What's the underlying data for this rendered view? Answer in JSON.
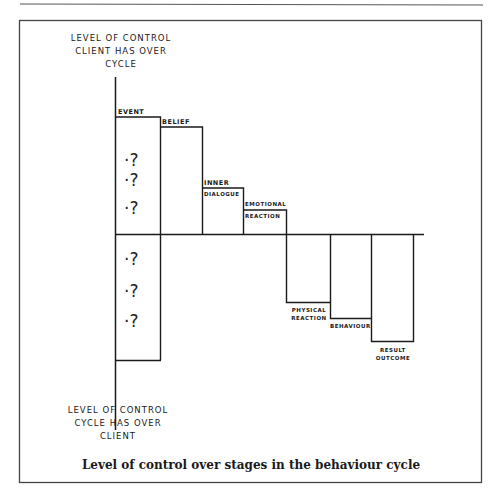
{
  "figure": {
    "caption": "Level of control over stages in the behaviour cycle",
    "axis_top_label": [
      "LEVEL OF CONTROL",
      "CLIENT HAS OVER",
      "CYCLE"
    ],
    "axis_bottom_label": [
      "LEVEL OF CONTROL",
      "CYCLE HAS OVER",
      "CLIENT"
    ],
    "unknown_marker": "?",
    "stages_above": [
      {
        "id": "event",
        "label_lines": [
          "EVENT"
        ]
      },
      {
        "id": "belief",
        "label_lines": [
          "BELIEF"
        ]
      },
      {
        "id": "inner-dialogue",
        "label_lines": [
          "INNER",
          "DIALOGUE"
        ]
      },
      {
        "id": "emotional-reaction",
        "label_lines": [
          "EMOTIONAL",
          "REACTION"
        ]
      }
    ],
    "stages_below": [
      {
        "id": "physical-reaction",
        "label_lines": [
          "PHYSICAL",
          "REACTION"
        ]
      },
      {
        "id": "behaviour",
        "label_lines": [
          "BEHAVIOUR"
        ]
      },
      {
        "id": "result-outcome",
        "label_lines": [
          "RESULT",
          "OUTCOME"
        ]
      }
    ],
    "colors": {
      "ink": "#1a1a1a",
      "frame": "#444444",
      "background": "#ffffff"
    }
  }
}
